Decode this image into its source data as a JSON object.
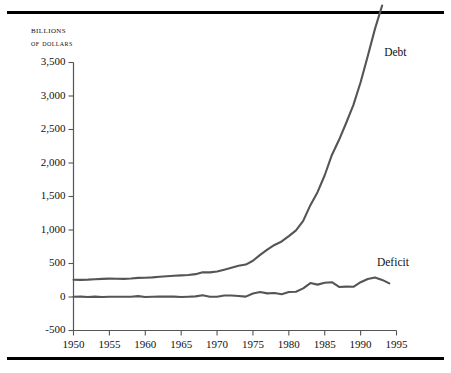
{
  "figure": {
    "axis_title_line1": "Billions",
    "axis_title_line2": "of dollars",
    "rule_color": "#000000",
    "line_color": "#555555",
    "background": "#ffffff"
  },
  "chart_data": {
    "type": "line",
    "title": "",
    "subtitle": "",
    "xlabel": "",
    "ylabel": "Billions of dollars",
    "xlim": [
      1950,
      1995
    ],
    "ylim": [
      -500,
      3500
    ],
    "ytick_labels": [
      "3,500",
      "3,000",
      "2,500",
      "2,000",
      "1,500",
      "1,000",
      "500",
      "0",
      "-500"
    ],
    "ytick_values": [
      3500,
      3000,
      2500,
      2000,
      1500,
      1000,
      500,
      0,
      -500
    ],
    "xtick_labels": [
      "1950",
      "1955",
      "1960",
      "1965",
      "1970",
      "1975",
      "1980",
      "1985",
      "1990",
      "1995"
    ],
    "xtick_values": [
      1950,
      1955,
      1960,
      1965,
      1970,
      1975,
      1980,
      1985,
      1990,
      1995
    ],
    "grid": false,
    "legend_position": "inline-annotation",
    "x": [
      1950,
      1951,
      1952,
      1953,
      1954,
      1955,
      1956,
      1957,
      1958,
      1959,
      1960,
      1961,
      1962,
      1963,
      1964,
      1965,
      1966,
      1967,
      1968,
      1969,
      1970,
      1971,
      1972,
      1973,
      1974,
      1975,
      1976,
      1977,
      1978,
      1979,
      1980,
      1981,
      1982,
      1983,
      1984,
      1985,
      1986,
      1987,
      1988,
      1989,
      1990,
      1991,
      1992,
      1993,
      1994
    ],
    "series": [
      {
        "name": "Debt",
        "label": "Debt",
        "color": "#555555",
        "values": [
          257,
          255,
          259,
          266,
          271,
          274,
          273,
          271,
          276,
          285,
          287,
          293,
          303,
          310,
          317,
          323,
          329,
          341,
          370,
          367,
          381,
          408,
          436,
          466,
          484,
          541,
          629,
          706,
          777,
          829,
          909,
          994,
          1137,
          1371,
          1564,
          1817,
          2120,
          2346,
          2601,
          2868,
          3206,
          3598,
          4002,
          4351,
          3500
        ]
      },
      {
        "name": "Deficit",
        "label": "Deficit",
        "color": "#555555",
        "values": [
          -3,
          6,
          -1,
          -6,
          -1,
          -3,
          4,
          3,
          -3,
          -13,
          0,
          -3,
          -7,
          -5,
          -6,
          -1,
          -4,
          -9,
          -25,
          3,
          -3,
          -23,
          -23,
          -15,
          -6,
          -53,
          -74,
          -54,
          -59,
          -41,
          -74,
          -79,
          -128,
          -208,
          -185,
          -212,
          -221,
          -150,
          -155,
          -152,
          -221,
          -269,
          -290,
          -255,
          -203
        ]
      }
    ],
    "annotations": [
      {
        "text": "Debt",
        "x": 1993,
        "y": 3620
      },
      {
        "text": "Deficit",
        "x": 1992,
        "y": 490
      }
    ]
  }
}
